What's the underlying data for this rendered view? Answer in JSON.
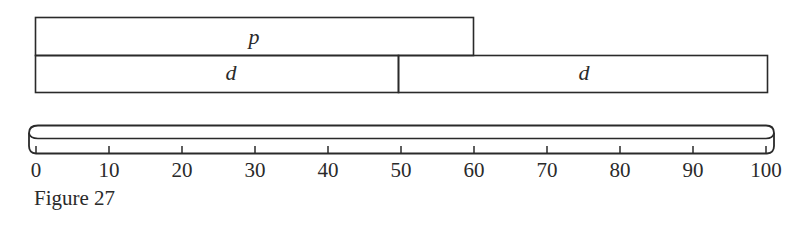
{
  "figure": {
    "caption": "Figure 27",
    "bars": [
      {
        "label": "p",
        "start": 0,
        "end": 60,
        "row": 0
      },
      {
        "label": "d",
        "start": 0,
        "end": 50,
        "row": 1
      },
      {
        "label": "d",
        "start": 50,
        "end": 100,
        "row": 1
      }
    ],
    "scale": {
      "min": 0,
      "max": 100,
      "step": 10,
      "ticks": [
        "0",
        "10",
        "20",
        "30",
        "40",
        "50",
        "60",
        "70",
        "80",
        "90",
        "100"
      ]
    },
    "colors": {
      "stroke": "#2a2a2a",
      "background": "#ffffff"
    }
  }
}
